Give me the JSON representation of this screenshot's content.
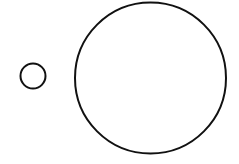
{
  "canvas": {
    "width": 239,
    "height": 164,
    "background": "#ffffff"
  },
  "shapes": [
    {
      "id": "small-circle",
      "type": "circle",
      "cx": 33,
      "cy": 76,
      "r": 12.5,
      "stroke": "#111111",
      "stroke_width": 2,
      "fill": "none"
    },
    {
      "id": "large-circle",
      "type": "circle",
      "cx": 150.5,
      "cy": 78,
      "r": 75.5,
      "stroke": "#111111",
      "stroke_width": 2,
      "fill": "none"
    }
  ]
}
